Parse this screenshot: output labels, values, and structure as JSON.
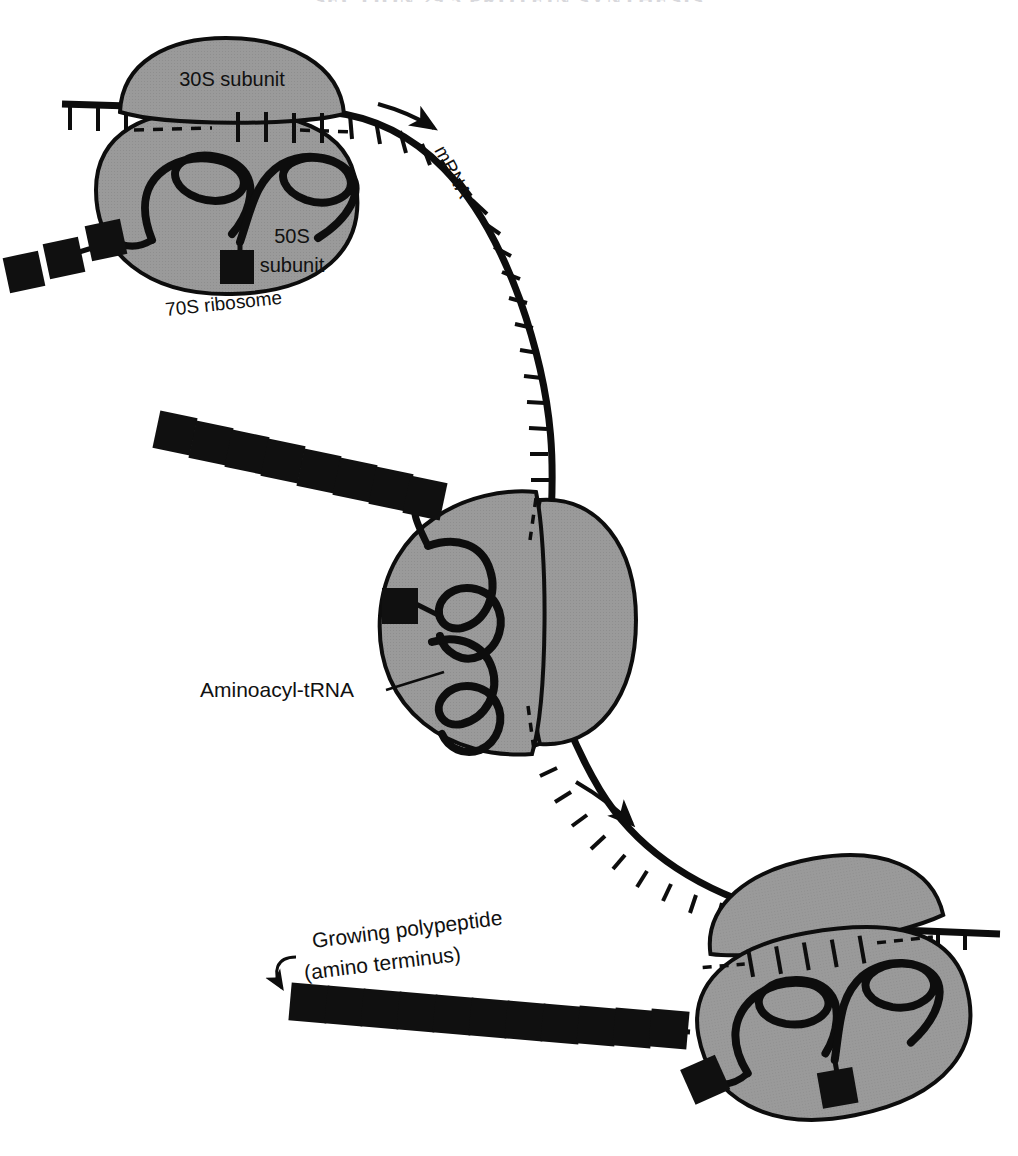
{
  "figure": {
    "title_cropped": "SECTION 29.5  PROTEIN SYNTHESIS",
    "caption_labels": {
      "subunit_small": "30S subunit",
      "subunit_large_line1": "50S",
      "subunit_large_line2": "subunit",
      "ribosome": "70S ribosome",
      "mrna": "mRNA",
      "trna": "Aminoacyl-tRNA",
      "polypeptide_line1": "Growing polypeptide",
      "polypeptide_line2": "(amino  terminus)"
    },
    "colors": {
      "subunit_fill": "#9a9a9a",
      "outline": "#0d0d0d",
      "amino_acid": "#101010",
      "background": "#ffffff",
      "text": "#111111"
    },
    "counts": {
      "ribosomes": 3,
      "polypeptide_squares_top": 3,
      "polypeptide_squares_middle": 8,
      "polypeptide_squares_bottom": 12,
      "trnas_per_ribosome": 2,
      "direction_arrows": 2
    },
    "icons": {
      "mrna_direction": "arrow-icon",
      "polypeptide_pointer": "curved-arrow-icon"
    }
  }
}
